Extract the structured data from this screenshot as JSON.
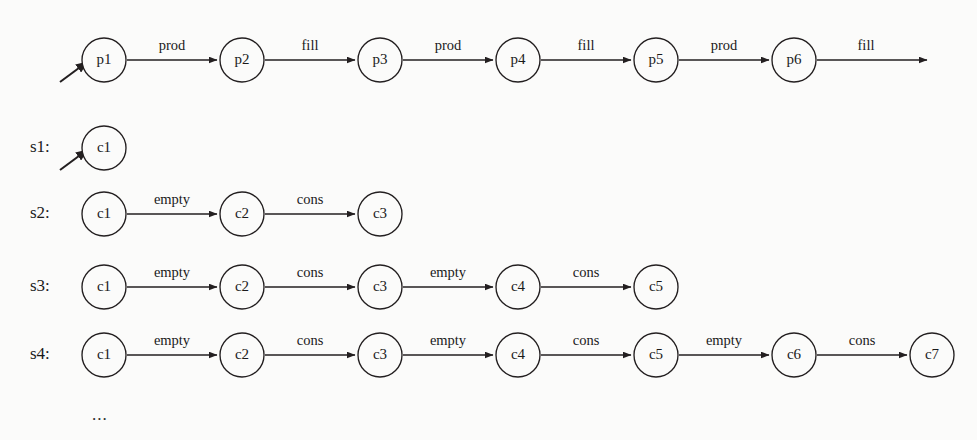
{
  "diagram": {
    "title": "",
    "background_color": "#fbfbfa",
    "stroke_color": "#231f20",
    "node_radius": 22,
    "node_spacing": 138,
    "first_node_x": 104,
    "ellipsis": "...",
    "rows": [
      {
        "id": "producer-row",
        "label": "",
        "y": 58,
        "has_entry_arrow": true,
        "trailing_arrow": true,
        "nodes": [
          "p1",
          "p2",
          "p3",
          "p4",
          "p5",
          "p6"
        ],
        "edges": [
          "prod",
          "fill",
          "prod",
          "fill",
          "prod"
        ],
        "trailing_edge_label": "fill"
      },
      {
        "id": "s1-row",
        "label": "s1:",
        "y": 146,
        "has_entry_arrow": true,
        "trailing_arrow": false,
        "nodes": [
          "c1"
        ],
        "edges": [],
        "trailing_edge_label": ""
      },
      {
        "id": "s2-row",
        "label": "s2:",
        "y": 212,
        "has_entry_arrow": false,
        "trailing_arrow": false,
        "nodes": [
          "c1",
          "c2",
          "c3"
        ],
        "edges": [
          "empty",
          "cons"
        ],
        "trailing_edge_label": ""
      },
      {
        "id": "s3-row",
        "label": "s3:",
        "y": 285,
        "has_entry_arrow": false,
        "trailing_arrow": false,
        "nodes": [
          "c1",
          "c2",
          "c3",
          "c4",
          "c5"
        ],
        "edges": [
          "empty",
          "cons",
          "empty",
          "cons"
        ],
        "trailing_edge_label": ""
      },
      {
        "id": "s4-row",
        "label": "s4:",
        "y": 353,
        "has_entry_arrow": false,
        "trailing_arrow": false,
        "nodes": [
          "c1",
          "c2",
          "c3",
          "c4",
          "c5",
          "c6",
          "c7"
        ],
        "edges": [
          "empty",
          "cons",
          "empty",
          "cons",
          "empty",
          "cons"
        ],
        "trailing_edge_label": ""
      }
    ]
  }
}
